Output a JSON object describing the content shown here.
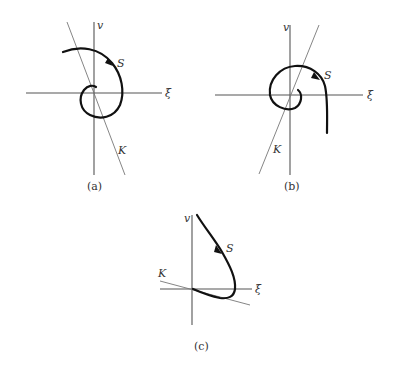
{
  "figure": {
    "panels": [
      {
        "id": "a",
        "caption": "(a)",
        "labels": {
          "vertical_axis": "v",
          "horizontal_axis": "ξ",
          "trajectory": "S",
          "line": "K"
        },
        "description": "Spiral trajectory S winding inward clockwise toward origin; line K with negative slope"
      },
      {
        "id": "b",
        "caption": "(b)",
        "labels": {
          "vertical_axis": "v",
          "horizontal_axis": "ξ",
          "trajectory": "S",
          "line": "K"
        },
        "description": "Spiral trajectory S winding outward clockwise from origin; line K with positive slope"
      },
      {
        "id": "c",
        "caption": "(c)",
        "labels": {
          "vertical_axis": "v",
          "horizontal_axis": "ξ",
          "trajectory": "S",
          "line": "K"
        },
        "description": "Trajectory S descending from upper region, curving back to origin approaching along line K with small negative slope"
      }
    ]
  }
}
